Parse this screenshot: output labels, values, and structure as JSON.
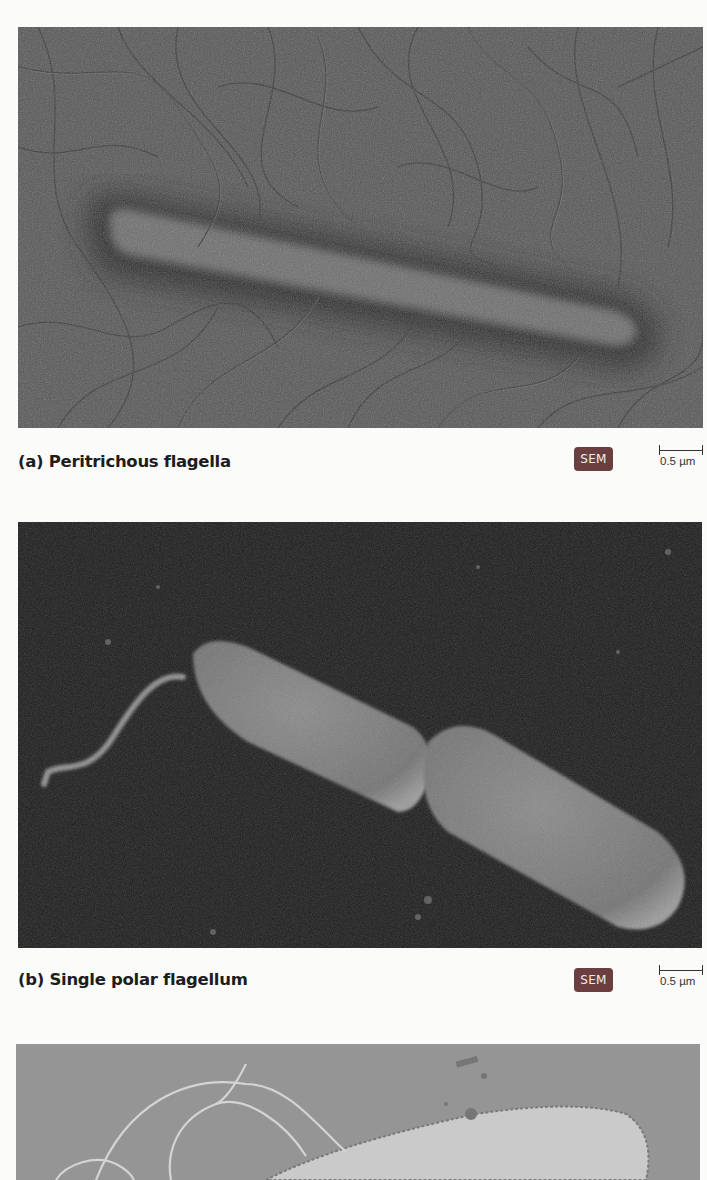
{
  "figures": [
    {
      "id": "a",
      "caption": "(a) Peritrichous flagella",
      "badge": "SEM",
      "scale_bar": "0.5 µm",
      "subject": "rod-shaped bacterium with many flagella distributed over surface",
      "colors": {
        "background": "#555555",
        "cell": "#6e6e6e",
        "halo": "#2e2e2e"
      }
    },
    {
      "id": "b",
      "caption": "(b) Single polar flagellum",
      "badge": "SEM",
      "scale_bar": "0.5 µm",
      "subject": "dividing rod-shaped bacterium with one flagellum at one pole",
      "colors": {
        "background": "#1c1c1c",
        "cell": "#7a7a7a"
      }
    },
    {
      "id": "c",
      "caption": "",
      "subject": "bacterium with tuft of flagella (partially visible)",
      "colors": {
        "background": "#8c8c8c",
        "cell": "#cfcfcf"
      }
    }
  ],
  "badge_color": "#6b3f3f"
}
